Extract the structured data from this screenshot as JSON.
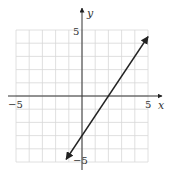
{
  "chart_data": {
    "type": "line",
    "title": "",
    "xlabel": "x",
    "ylabel": "y",
    "xlim": [
      -5,
      5
    ],
    "ylim": [
      -5,
      5
    ],
    "grid": true,
    "tick_labels": {
      "x": [
        "-5",
        "5"
      ],
      "y": [
        "5",
        "-5"
      ]
    },
    "series": [
      {
        "name": "y = 1.5x - 3",
        "slope": 1.5,
        "intercept": -3,
        "x": [
          -1.2,
          5
        ],
        "y": [
          -4.8,
          4.5
        ],
        "arrows": "both"
      }
    ]
  },
  "labels": {
    "x_axis": "x",
    "y_axis": "y",
    "x_min": "−5",
    "x_max": "5",
    "y_max": "5",
    "y_min": "−5"
  }
}
